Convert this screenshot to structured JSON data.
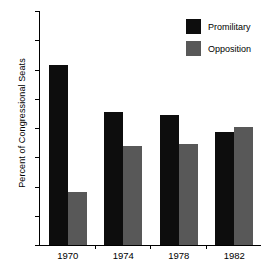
{
  "chart_data": {
    "type": "bar",
    "title": "",
    "subtitle": "",
    "xlabel": "",
    "ylabel": "Percent of Congressional Seats",
    "categories": [
      "1970",
      "1974",
      "1978",
      "1982"
    ],
    "series": [
      {
        "name": "Promilitary",
        "color": "#0d0d0d",
        "values": [
          71.5,
          55.5,
          54.6,
          48.6
        ]
      },
      {
        "name": "Opposition",
        "color": "#585858",
        "values": [
          28.0,
          43.8,
          44.6,
          50.5
        ]
      }
    ],
    "ylim": [
      10,
      90
    ],
    "ytick_labels": [
      "90",
      "80",
      "70",
      "60",
      "50",
      "40",
      "30",
      "20",
      "10"
    ],
    "ytick_values": [
      90,
      80,
      70,
      60,
      50,
      40,
      30,
      20,
      10
    ],
    "grid": false,
    "legend_position": "top-right"
  },
  "legend": {
    "entries": [
      {
        "label": "Promilitary",
        "icon": "legend-swatch-black"
      },
      {
        "label": "Opposition",
        "icon": "legend-swatch-gray"
      }
    ]
  },
  "axes": {
    "y_title": "Percent of Congressional Seats"
  }
}
